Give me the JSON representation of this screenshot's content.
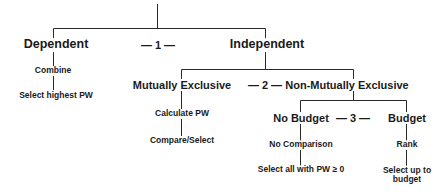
{
  "diagram": {
    "nodes": {
      "dependent": "Dependent",
      "combine": "Combine",
      "select_highest_pw": "Select highest PW",
      "independent": "Independent",
      "mutually_exclusive": "Mutually Exclusive",
      "calculate_pw": "Calculate PW",
      "compare_select": "Compare/Select",
      "non_mutually_exclusive": "Non-Mutually Exclusive",
      "no_budget": "No Budget",
      "no_comparison": "No Comparison",
      "select_all_pw": "Select all with PW ≥ 0",
      "budget": "Budget",
      "rank": "Rank",
      "select_up_to_budget": "Select up to budget"
    },
    "markers": {
      "m1": "— 1 —",
      "m2": "— 2 —",
      "m3": "— 3 —"
    },
    "line_color": "#2a2a2a"
  }
}
